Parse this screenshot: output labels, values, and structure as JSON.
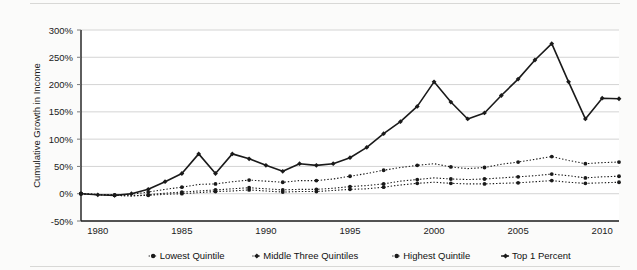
{
  "chart_data": {
    "type": "line",
    "title": "",
    "subtitle": "",
    "xlabel": "",
    "ylabel": "Cumulative Growth in Income",
    "xlim": [
      1979,
      2011
    ],
    "ylim": [
      -50,
      300
    ],
    "ytick_labels": [
      "300%",
      "250%",
      "200%",
      "150%",
      "100%",
      "50%",
      "0%",
      "-50%"
    ],
    "ytick_values": [
      300,
      250,
      200,
      150,
      100,
      50,
      0,
      -50
    ],
    "xtick_labels": [
      "1980",
      "1985",
      "1990",
      "1995",
      "2000",
      "2005",
      "2010"
    ],
    "xtick_values": [
      1980,
      1985,
      1990,
      1995,
      2000,
      2005,
      2010
    ],
    "grid": "horizontal",
    "legend_position": "bottom",
    "x": [
      1979,
      1980,
      1981,
      1982,
      1983,
      1984,
      1985,
      1986,
      1987,
      1988,
      1989,
      1990,
      1991,
      1992,
      1993,
      1994,
      1995,
      1996,
      1997,
      1998,
      1999,
      2000,
      2001,
      2002,
      2003,
      2004,
      2005,
      2006,
      2007,
      2008,
      2009,
      2010,
      2011
    ],
    "series": [
      {
        "name": "Lowest Quintile",
        "line_style": "dotted",
        "marker": "circle",
        "color": "#1a1a1a",
        "values": [
          0,
          -1,
          -3,
          -4,
          -3,
          -1,
          0,
          2,
          4,
          5,
          7,
          5,
          3,
          4,
          4,
          6,
          8,
          9,
          12,
          16,
          19,
          21,
          19,
          18,
          18,
          19,
          20,
          22,
          24,
          21,
          19,
          20,
          21
        ]
      },
      {
        "name": "Middle Three Quintiles",
        "line_style": "dotted",
        "marker": "circle",
        "color": "#1a1a1a",
        "values": [
          0,
          -2,
          -3,
          -4,
          -2,
          1,
          3,
          5,
          7,
          9,
          11,
          9,
          7,
          8,
          8,
          10,
          13,
          15,
          18,
          23,
          26,
          29,
          27,
          26,
          27,
          29,
          31,
          33,
          36,
          33,
          29,
          31,
          32
        ]
      },
      {
        "name": "Highest Quintile",
        "line_style": "dotted",
        "marker": "circle",
        "color": "#1a1a1a",
        "values": [
          0,
          -2,
          -2,
          -1,
          3,
          8,
          12,
          17,
          18,
          22,
          25,
          23,
          21,
          24,
          24,
          27,
          32,
          37,
          43,
          48,
          52,
          55,
          49,
          46,
          48,
          54,
          58,
          63,
          68,
          61,
          55,
          57,
          58
        ]
      },
      {
        "name": "Top 1 Percent",
        "line_style": "solid",
        "marker": "diamond",
        "color": "#1a1a1a",
        "values": [
          0,
          -2,
          -3,
          0,
          8,
          22,
          37,
          73,
          37,
          73,
          64,
          52,
          41,
          55,
          52,
          55,
          66,
          85,
          110,
          132,
          160,
          205,
          168,
          137,
          148,
          180,
          210,
          245,
          275,
          205,
          137,
          175,
          174
        ]
      }
    ]
  },
  "legend": {
    "items": [
      {
        "label": "Lowest Quintile",
        "marker": "dotted-circle"
      },
      {
        "label": "Middle Three Quintiles",
        "marker": "dotted-diamond"
      },
      {
        "label": "Highest Quintile",
        "marker": "dotted-circle"
      },
      {
        "label": "Top 1 Percent",
        "marker": "solid-diamond"
      }
    ]
  }
}
